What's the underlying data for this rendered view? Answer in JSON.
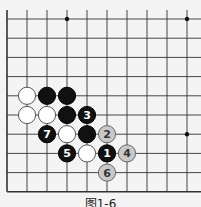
{
  "diagram": {
    "type": "go-board-fragment",
    "caption": "图1-6",
    "grid": {
      "origin_x": 7,
      "origin_y": 19,
      "spacing_x": 20,
      "spacing_y": 19.2,
      "cols": 10,
      "rows": 10,
      "left_edge": true,
      "bottom_edge": true,
      "line_color": "#333333"
    },
    "star_points": [
      {
        "col": 3,
        "row": 0
      },
      {
        "col": 9,
        "row": 0
      },
      {
        "col": 9,
        "row": 6
      }
    ],
    "stones": [
      {
        "color": "white",
        "col": 1,
        "row": 4,
        "label": ""
      },
      {
        "color": "black",
        "col": 2,
        "row": 4,
        "label": ""
      },
      {
        "color": "black",
        "col": 3,
        "row": 4,
        "label": ""
      },
      {
        "color": "white",
        "col": 1,
        "row": 5,
        "label": ""
      },
      {
        "color": "white",
        "col": 2,
        "row": 5,
        "label": ""
      },
      {
        "color": "black",
        "col": 3,
        "row": 5,
        "label": ""
      },
      {
        "color": "black",
        "col": 4,
        "row": 5,
        "label": "3"
      },
      {
        "color": "black",
        "col": 2,
        "row": 6,
        "label": "7"
      },
      {
        "color": "white",
        "col": 3,
        "row": 6,
        "label": ""
      },
      {
        "color": "black",
        "col": 4,
        "row": 6,
        "label": ""
      },
      {
        "color": "white-numbered",
        "col": 5,
        "row": 6,
        "label": "2"
      },
      {
        "color": "black",
        "col": 3,
        "row": 7,
        "label": "5"
      },
      {
        "color": "white",
        "col": 4,
        "row": 7,
        "label": ""
      },
      {
        "color": "black",
        "col": 5,
        "row": 7,
        "label": "1"
      },
      {
        "color": "white-numbered",
        "col": 6,
        "row": 7,
        "label": "4"
      },
      {
        "color": "white-numbered",
        "col": 5,
        "row": 8,
        "label": "6"
      }
    ],
    "colors": {
      "black_stone": "#111111",
      "white_stone": "#ffffff",
      "numbered_white_stone": "#c8c8c8",
      "stone_outline": "#555555",
      "background": "#f4f4f4"
    }
  }
}
